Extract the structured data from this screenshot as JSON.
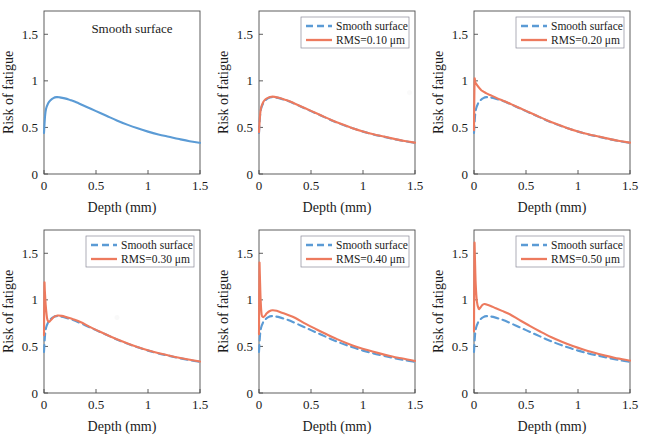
{
  "figure": {
    "rows": 2,
    "cols": 3,
    "background": "#ffffff"
  },
  "axes": {
    "xlabel": "Depth (mm)",
    "ylabel": "Risk of fatigue",
    "xticks": [
      "0",
      "0.5",
      "1",
      "1.5"
    ],
    "yticks": [
      "0",
      "0.5",
      "1",
      "1.5"
    ],
    "xtick_values": [
      0,
      0.5,
      1,
      1.5
    ],
    "ytick_values": [
      0,
      0.5,
      1,
      1.5
    ],
    "xlim": [
      0,
      1.5
    ],
    "ylim": [
      0,
      1.75
    ],
    "grid": false
  },
  "legend": {
    "smooth_label": "Smooth surface",
    "position": "upper right",
    "smooth_style": "dashed",
    "rough_style": "solid"
  },
  "colors": {
    "smooth": "#5B9BD5",
    "rough": "#ED7A5E",
    "axis": "#4d4d4d",
    "text": "#1b1b1b",
    "legend_border": "#8a8a99"
  },
  "chart_data": {
    "type": "line",
    "title": "",
    "xlabel": "Depth (mm)",
    "ylabel": "Risk of fatigue",
    "xlim": [
      0,
      1.5
    ],
    "ylim": [
      0,
      1.75
    ],
    "grid": false,
    "legend_position": "upper right",
    "panels": [
      {
        "index": 0,
        "panel_title": "Smooth surface",
        "legend_entries": [],
        "rms_value": null,
        "series": [
          {
            "name": "Smooth surface",
            "style": "solid",
            "color": "#5B9BD5",
            "x": [
              0,
              0.01,
              0.02,
              0.04,
              0.06,
              0.09,
              0.12,
              0.15,
              0.2,
              0.25,
              0.3,
              0.4,
              0.5,
              0.6,
              0.7,
              0.8,
              0.9,
              1.0,
              1.1,
              1.2,
              1.3,
              1.4,
              1.5
            ],
            "y": [
              0.44,
              0.62,
              0.7,
              0.76,
              0.79,
              0.815,
              0.825,
              0.823,
              0.812,
              0.795,
              0.775,
              0.725,
              0.675,
              0.625,
              0.575,
              0.53,
              0.49,
              0.455,
              0.425,
              0.4,
              0.375,
              0.352,
              0.335
            ]
          }
        ]
      },
      {
        "index": 1,
        "panel_title": "",
        "legend_entries": [
          "Smooth surface",
          "RMS=0.10 μm"
        ],
        "rms_value": 0.1,
        "series": [
          {
            "name": "Smooth surface",
            "style": "dashed",
            "color": "#5B9BD5",
            "x": [
              0,
              0.01,
              0.02,
              0.04,
              0.06,
              0.09,
              0.12,
              0.15,
              0.2,
              0.25,
              0.3,
              0.4,
              0.5,
              0.6,
              0.7,
              0.8,
              0.9,
              1.0,
              1.1,
              1.2,
              1.3,
              1.4,
              1.5
            ],
            "y": [
              0.44,
              0.62,
              0.7,
              0.76,
              0.79,
              0.815,
              0.825,
              0.823,
              0.812,
              0.795,
              0.775,
              0.725,
              0.675,
              0.625,
              0.575,
              0.53,
              0.49,
              0.455,
              0.425,
              0.4,
              0.375,
              0.352,
              0.335
            ]
          },
          {
            "name": "RMS=0.10 μm",
            "style": "solid",
            "color": "#ED7A5E",
            "x": [
              0,
              0.01,
              0.02,
              0.04,
              0.06,
              0.09,
              0.12,
              0.15,
              0.2,
              0.25,
              0.3,
              0.4,
              0.5,
              0.6,
              0.7,
              0.8,
              0.9,
              1.0,
              1.1,
              1.2,
              1.3,
              1.4,
              1.5
            ],
            "y": [
              0.45,
              0.63,
              0.71,
              0.77,
              0.8,
              0.82,
              0.83,
              0.828,
              0.815,
              0.798,
              0.778,
              0.728,
              0.678,
              0.628,
              0.578,
              0.533,
              0.492,
              0.457,
              0.427,
              0.402,
              0.377,
              0.354,
              0.337
            ]
          }
        ]
      },
      {
        "index": 2,
        "panel_title": "",
        "legend_entries": [
          "Smooth surface",
          "RMS=0.20 μm"
        ],
        "rms_value": 0.2,
        "series": [
          {
            "name": "Smooth surface",
            "style": "dashed",
            "color": "#5B9BD5",
            "x": [
              0,
              0.01,
              0.02,
              0.04,
              0.06,
              0.09,
              0.12,
              0.15,
              0.2,
              0.25,
              0.3,
              0.4,
              0.5,
              0.6,
              0.7,
              0.8,
              0.9,
              1.0,
              1.1,
              1.2,
              1.3,
              1.4,
              1.5
            ],
            "y": [
              0.44,
              0.62,
              0.7,
              0.76,
              0.79,
              0.815,
              0.825,
              0.823,
              0.812,
              0.795,
              0.775,
              0.725,
              0.675,
              0.625,
              0.575,
              0.53,
              0.49,
              0.455,
              0.425,
              0.4,
              0.375,
              0.352,
              0.335
            ]
          },
          {
            "name": "RMS=0.20 μm",
            "style": "solid",
            "color": "#ED7A5E",
            "x": [
              0,
              0.005,
              0.012,
              0.02,
              0.035,
              0.05,
              0.07,
              0.09,
              0.12,
              0.16,
              0.2,
              0.25,
              0.3,
              0.4,
              0.5,
              0.6,
              0.7,
              0.8,
              0.9,
              1.0,
              1.1,
              1.2,
              1.3,
              1.4,
              1.5
            ],
            "y": [
              0.47,
              0.99,
              0.985,
              0.97,
              0.945,
              0.925,
              0.9,
              0.885,
              0.865,
              0.845,
              0.825,
              0.8,
              0.778,
              0.728,
              0.678,
              0.628,
              0.578,
              0.533,
              0.492,
              0.457,
              0.427,
              0.402,
              0.377,
              0.354,
              0.337
            ]
          }
        ]
      },
      {
        "index": 3,
        "panel_title": "",
        "legend_entries": [
          "Smooth surface",
          "RMS=0.30 μm"
        ],
        "rms_value": 0.3,
        "series": [
          {
            "name": "Smooth surface",
            "style": "dashed",
            "color": "#5B9BD5",
            "x": [
              0,
              0.01,
              0.02,
              0.04,
              0.06,
              0.09,
              0.12,
              0.15,
              0.2,
              0.25,
              0.3,
              0.4,
              0.5,
              0.6,
              0.7,
              0.8,
              0.9,
              1.0,
              1.1,
              1.2,
              1.3,
              1.4,
              1.5
            ],
            "y": [
              0.44,
              0.62,
              0.7,
              0.76,
              0.79,
              0.815,
              0.825,
              0.823,
              0.812,
              0.795,
              0.775,
              0.725,
              0.675,
              0.625,
              0.575,
              0.53,
              0.49,
              0.455,
              0.425,
              0.4,
              0.375,
              0.352,
              0.335
            ]
          },
          {
            "name": "RMS=0.30 μm",
            "style": "solid",
            "color": "#ED7A5E",
            "x": [
              0,
              0.004,
              0.008,
              0.016,
              0.03,
              0.045,
              0.06,
              0.08,
              0.1,
              0.13,
              0.17,
              0.22,
              0.28,
              0.35,
              0.45,
              0.55,
              0.65,
              0.75,
              0.85,
              0.95,
              1.05,
              1.15,
              1.25,
              1.35,
              1.5
            ],
            "y": [
              0.62,
              1.16,
              1.1,
              0.95,
              0.8,
              0.765,
              0.775,
              0.8,
              0.82,
              0.832,
              0.828,
              0.812,
              0.792,
              0.762,
              0.705,
              0.652,
              0.602,
              0.555,
              0.512,
              0.475,
              0.443,
              0.415,
              0.39,
              0.368,
              0.338
            ]
          }
        ]
      },
      {
        "index": 4,
        "panel_title": "",
        "legend_entries": [
          "Smooth surface",
          "RMS=0.40 μm"
        ],
        "rms_value": 0.4,
        "series": [
          {
            "name": "Smooth surface",
            "style": "dashed",
            "color": "#5B9BD5",
            "x": [
              0,
              0.01,
              0.02,
              0.04,
              0.06,
              0.09,
              0.12,
              0.15,
              0.2,
              0.25,
              0.3,
              0.4,
              0.5,
              0.6,
              0.7,
              0.8,
              0.9,
              1.0,
              1.1,
              1.2,
              1.3,
              1.4,
              1.5
            ],
            "y": [
              0.44,
              0.62,
              0.7,
              0.76,
              0.79,
              0.815,
              0.825,
              0.823,
              0.812,
              0.795,
              0.775,
              0.725,
              0.675,
              0.625,
              0.575,
              0.53,
              0.49,
              0.455,
              0.425,
              0.4,
              0.375,
              0.352,
              0.335
            ]
          },
          {
            "name": "RMS=0.40 μm",
            "style": "solid",
            "color": "#ED7A5E",
            "x": [
              0,
              0.004,
              0.008,
              0.015,
              0.025,
              0.04,
              0.055,
              0.075,
              0.1,
              0.13,
              0.17,
              0.22,
              0.28,
              0.35,
              0.45,
              0.55,
              0.65,
              0.75,
              0.85,
              0.95,
              1.05,
              1.15,
              1.25,
              1.35,
              1.5
            ],
            "y": [
              0.63,
              1.36,
              1.28,
              1.02,
              0.845,
              0.815,
              0.828,
              0.855,
              0.878,
              0.888,
              0.882,
              0.862,
              0.838,
              0.805,
              0.742,
              0.685,
              0.63,
              0.578,
              0.532,
              0.492,
              0.458,
              0.428,
              0.4,
              0.375,
              0.345
            ]
          }
        ]
      },
      {
        "index": 5,
        "panel_title": "",
        "legend_entries": [
          "Smooth surface",
          "RMS=0.50 μm"
        ],
        "rms_value": 0.5,
        "series": [
          {
            "name": "Smooth surface",
            "style": "dashed",
            "color": "#5B9BD5",
            "x": [
              0,
              0.01,
              0.02,
              0.04,
              0.06,
              0.09,
              0.12,
              0.15,
              0.2,
              0.25,
              0.3,
              0.4,
              0.5,
              0.6,
              0.7,
              0.8,
              0.9,
              1.0,
              1.1,
              1.2,
              1.3,
              1.4,
              1.5
            ],
            "y": [
              0.44,
              0.62,
              0.7,
              0.76,
              0.79,
              0.815,
              0.825,
              0.823,
              0.812,
              0.795,
              0.775,
              0.725,
              0.675,
              0.625,
              0.575,
              0.53,
              0.49,
              0.455,
              0.425,
              0.4,
              0.375,
              0.352,
              0.335
            ]
          },
          {
            "name": "RMS=0.50 μm",
            "style": "solid",
            "color": "#ED7A5E",
            "x": [
              0,
              0.004,
              0.009,
              0.016,
              0.028,
              0.045,
              0.06,
              0.08,
              0.1,
              0.12,
              0.16,
              0.21,
              0.27,
              0.34,
              0.44,
              0.54,
              0.64,
              0.74,
              0.85,
              0.95,
              1.05,
              1.15,
              1.25,
              1.35,
              1.5
            ],
            "y": [
              0.66,
              1.57,
              1.45,
              1.18,
              0.98,
              0.905,
              0.915,
              0.945,
              0.955,
              0.95,
              0.935,
              0.91,
              0.882,
              0.848,
              0.782,
              0.718,
              0.658,
              0.602,
              0.548,
              0.505,
              0.468,
              0.435,
              0.405,
              0.378,
              0.348
            ]
          }
        ]
      }
    ]
  }
}
